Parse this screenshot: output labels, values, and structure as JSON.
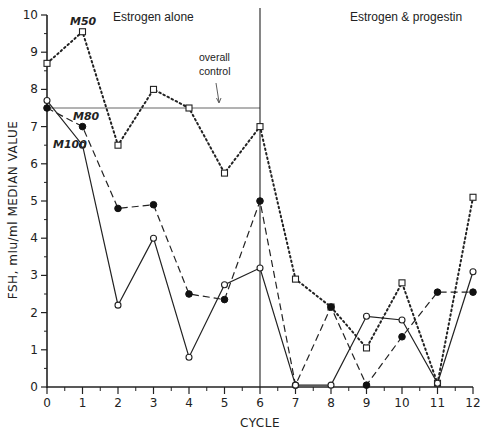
{
  "chart_data": {
    "type": "line",
    "title": "",
    "xlabel": "CYCLE",
    "ylabel": "FSH, mIu/ml  MEDIAN  VALUE",
    "xlim": [
      0,
      12
    ],
    "ylim": [
      0,
      10
    ],
    "x": [
      0,
      1,
      2,
      3,
      4,
      5,
      6,
      7,
      8,
      9,
      10,
      11,
      12
    ],
    "x_ticks": [
      "0",
      "1",
      "2",
      "3",
      "4",
      "5",
      "6",
      "7",
      "8",
      "9",
      "10",
      "11",
      "12"
    ],
    "y_ticks": [
      "0",
      "1",
      "2",
      "3",
      "4",
      "5",
      "6",
      "7",
      "8",
      "9",
      "10"
    ],
    "grid": false,
    "legend_position": "inline labels near series start",
    "series": [
      {
        "name": "M50",
        "line_style": "dotted",
        "marker": "open-square",
        "values": [
          8.7,
          9.55,
          6.5,
          8.0,
          7.5,
          5.75,
          7.0,
          2.9,
          2.15,
          1.05,
          2.8,
          0.1,
          5.1
        ]
      },
      {
        "name": "M80",
        "line_style": "dashed",
        "marker": "filled-circle",
        "values": [
          7.5,
          7.0,
          4.8,
          4.9,
          2.5,
          2.35,
          5.0,
          0.05,
          2.15,
          0.05,
          1.35,
          2.55,
          2.55
        ]
      },
      {
        "name": "M100",
        "line_style": "solid",
        "marker": "open-circle",
        "values": [
          7.7,
          6.5,
          2.2,
          4.0,
          0.8,
          2.75,
          3.2,
          0.05,
          0.05,
          1.9,
          1.8,
          0.1,
          3.1
        ]
      }
    ],
    "reference_lines": [
      {
        "name": "overall control",
        "type": "horizontal",
        "y": 7.5,
        "x_range": [
          0,
          6
        ]
      },
      {
        "name": "phase divider",
        "type": "vertical",
        "x": 6
      }
    ],
    "annotations": [
      {
        "text": "Estrogen alone",
        "region": "cycles 0-6"
      },
      {
        "text": "Estrogen & progestin",
        "region": "cycles 6-12"
      },
      {
        "text": "overall\ncontrol",
        "points_to": "horizontal line at 7.5"
      }
    ]
  },
  "labels": {
    "phase_left": "Estrogen alone",
    "phase_right": "Estrogen & progestin",
    "control_line1": "overall",
    "control_line2": "control",
    "xlabel": "CYCLE",
    "ylabel": "FSH, mIu/ml  MEDIAN  VALUE",
    "series_m50": "M50",
    "series_m80": "M80",
    "series_m100": "M100"
  }
}
